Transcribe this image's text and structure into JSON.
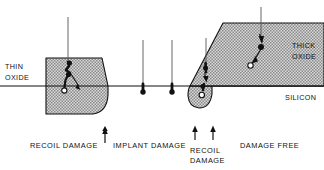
{
  "figure": {
    "background_color": "#ffffff",
    "line_color": "#111111",
    "oxide_fill_color": "#b8b8b8",
    "width": 324,
    "height": 170
  },
  "region_labels": {
    "thin_oxide": {
      "line1": "THIN",
      "line2": "OXIDE"
    },
    "thick_oxide": {
      "line1": "THICK",
      "line2": "OXIDE"
    },
    "silicon": "SILICON"
  },
  "captions": [
    {
      "id": "recoil-damage-left",
      "text": "RECOIL  DAMAGE",
      "line2": ""
    },
    {
      "id": "implant-damage",
      "text": "IMPLANT  DAMAGE",
      "line2": ""
    },
    {
      "id": "recoil-damage-right",
      "text": "RECOIL",
      "line2": "DAMAGE"
    },
    {
      "id": "damage-free",
      "text": "DAMAGE  FREE",
      "line2": ""
    }
  ],
  "pointer_arrows": [
    {
      "id": "arrow-recoil-left",
      "x": 105
    },
    {
      "id": "arrow-recoil-right-a",
      "x": 195
    },
    {
      "id": "arrow-recoil-right-b",
      "x": 213
    }
  ],
  "ion_tracks": [
    {
      "id": "ion-track-thin-oxide",
      "entry_x": 68,
      "entry_y": 17,
      "stopped": true
    },
    {
      "id": "ion-track-implant-1",
      "entry_x": 143,
      "entry_y": 40,
      "stopped": true
    },
    {
      "id": "ion-track-implant-2",
      "entry_x": 172,
      "entry_y": 40,
      "stopped": true
    },
    {
      "id": "ion-track-birds-beak",
      "entry_x": 206,
      "entry_y": 38,
      "stopped": true
    },
    {
      "id": "ion-track-thick-oxide",
      "entry_x": 261,
      "entry_y": 7,
      "stopped": true
    }
  ],
  "silicon_surface": {
    "y": 86,
    "x_start": 0,
    "x_end": 324
  }
}
